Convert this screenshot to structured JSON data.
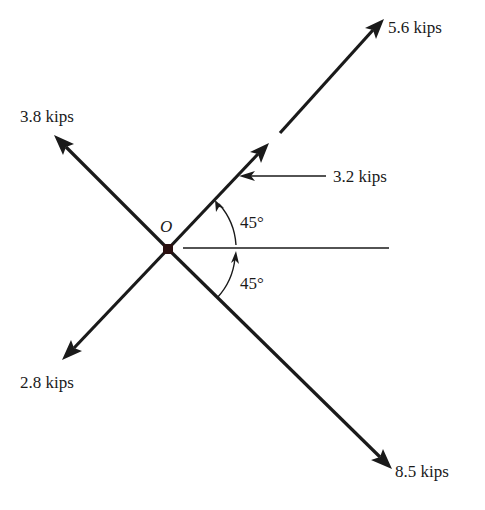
{
  "diagram": {
    "origin_label": "O",
    "forces": [
      {
        "id": "f1",
        "label": "5.6 kips",
        "direction": "up-right 45°"
      },
      {
        "id": "f2",
        "label": "3.8 kips",
        "direction": "up-left 135°"
      },
      {
        "id": "f3",
        "label": "2.8 kips",
        "direction": "down-left 225°"
      },
      {
        "id": "f4",
        "label": "8.5 kips",
        "direction": "down-right 315°"
      },
      {
        "id": "f5",
        "label": "3.2 kips",
        "direction": "horizontal, acting leftward on 45° line"
      }
    ],
    "angles": [
      {
        "label": "45°",
        "position": "above horizontal"
      },
      {
        "label": "45°",
        "position": "below horizontal"
      }
    ],
    "colors": {
      "ink": "#1a1a1a",
      "background": "#ffffff"
    }
  }
}
